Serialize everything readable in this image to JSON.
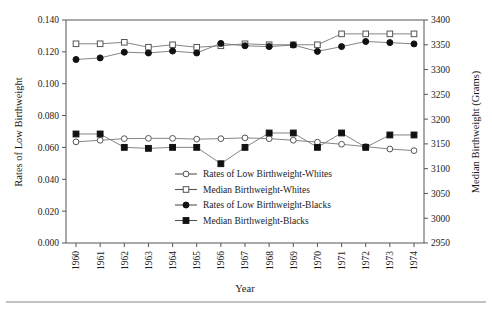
{
  "chart_data": {
    "type": "line",
    "title": "",
    "xlabel": "Year",
    "ylabel": "Rates of Low Birthweight",
    "y2label": "Median Birthweight (Grams)",
    "x": [
      1960,
      1961,
      1962,
      1963,
      1964,
      1965,
      1966,
      1967,
      1968,
      1969,
      1970,
      1971,
      1972,
      1973,
      1974
    ],
    "categories": [
      "1960",
      "1961",
      "1962",
      "1963",
      "1964",
      "1965",
      "1966",
      "1967",
      "1968",
      "1969",
      "1970",
      "1971",
      "1972",
      "1973",
      "1974"
    ],
    "ylim": [
      0.0,
      0.14
    ],
    "ytick_labels": [
      "0.000",
      "0.020",
      "0.040",
      "0.060",
      "0.080",
      "0.100",
      "0.120",
      "0.140"
    ],
    "ytick_values": [
      0.0,
      0.02,
      0.04,
      0.06,
      0.08,
      0.1,
      0.12,
      0.14
    ],
    "y2lim": [
      2950,
      3400
    ],
    "y2tick_labels": [
      "2950",
      "3000",
      "3050",
      "3100",
      "3150",
      "3200",
      "3250",
      "3300",
      "3350",
      "3400"
    ],
    "y2tick_values": [
      2950,
      3000,
      3050,
      3100,
      3150,
      3200,
      3250,
      3300,
      3350,
      3400
    ],
    "grid": false,
    "legend_position": "inside-lower-center-right",
    "series": [
      {
        "name": "Rates of Low Birthweight-Whites",
        "axis": "left",
        "marker": "open-circle",
        "color": "#777777",
        "values": [
          0.0635,
          0.0645,
          0.0655,
          0.0657,
          0.0657,
          0.0652,
          0.0655,
          0.066,
          0.0655,
          0.0645,
          0.0633,
          0.062,
          0.0605,
          0.059,
          0.058
        ]
      },
      {
        "name": "Median Birthweight-Whites",
        "axis": "right",
        "marker": "open-square",
        "color": "#777777",
        "values": [
          3352,
          3352,
          3355,
          3345,
          3350,
          3345,
          3348,
          3352,
          3350,
          3350,
          3350,
          3372,
          3372,
          3372,
          3372
        ]
      },
      {
        "name": "Rates of Low Birthweight-Blacks",
        "axis": "left",
        "marker": "filled-circle",
        "color": "#111111",
        "values": [
          0.1152,
          0.1162,
          0.1198,
          0.1193,
          0.1205,
          0.1193,
          0.1253,
          0.1238,
          0.1233,
          0.1243,
          0.1203,
          0.1233,
          0.1265,
          0.1258,
          0.125
        ]
      },
      {
        "name": "Median Birthweight-Blacks",
        "axis": "right",
        "marker": "filled-square",
        "color": "#111111",
        "values": [
          3170,
          3170,
          3143,
          3141,
          3143,
          3143,
          3110,
          3143,
          3172,
          3172,
          3143,
          3172,
          3143,
          3168,
          3168
        ]
      }
    ]
  },
  "axes": {
    "left_title": "Rates of Low Birthweight",
    "right_title": "Median Birthweight (Grams)",
    "x_title": "Year"
  },
  "legend": {
    "items": [
      {
        "label": "Rates of Low Birthweight-Whites",
        "marker": "open-circle"
      },
      {
        "label": "Median Birthweight-Whites",
        "marker": "open-square"
      },
      {
        "label": "Rates of Low Birthweight-Blacks",
        "marker": "filled-circle"
      },
      {
        "label": "Median Birthweight-Blacks",
        "marker": "filled-square"
      }
    ]
  }
}
